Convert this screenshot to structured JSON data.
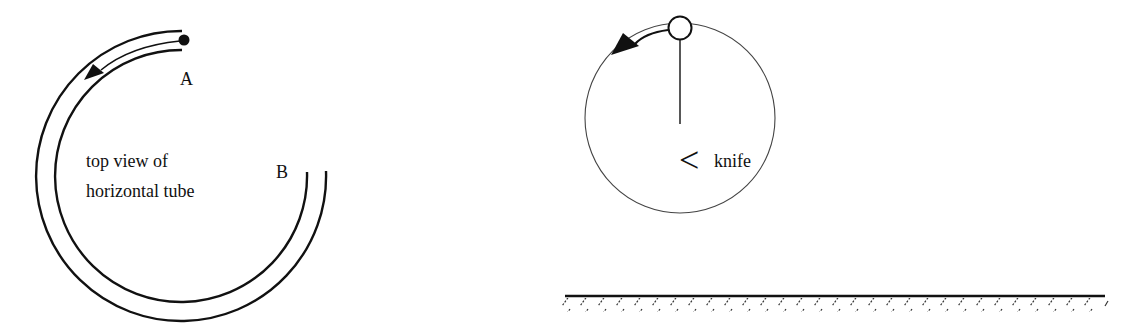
{
  "figure_left": {
    "title": "top view of horizontal tube",
    "caption_line1": "top view of",
    "caption_line2": "horizontal tube",
    "point_a_label": "A",
    "point_b_label": "B",
    "elements": [
      "curved-tube",
      "ball",
      "motion-arrow"
    ]
  },
  "figure_right": {
    "knife_symbol": "<",
    "knife_label": "knife",
    "elements": [
      "vertical-circle",
      "pendulum-bob",
      "string",
      "motion-arrow",
      "ground"
    ]
  },
  "colors": {
    "ink": "#111111",
    "background": "#ffffff"
  }
}
